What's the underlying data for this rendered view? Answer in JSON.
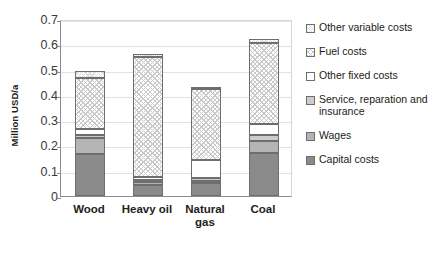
{
  "chart_data": {
    "type": "bar",
    "subtype": "stacked-bar",
    "title": "",
    "xlabel": "",
    "ylabel": "Million USD/a",
    "ylim": [
      0,
      0.7
    ],
    "ytick_labels": [
      "0.7",
      "0.6",
      "0.5",
      "0.4",
      "0.3",
      "0.2",
      "0.1",
      "0"
    ],
    "ytick_values": [
      0.7,
      0.6,
      0.5,
      0.4,
      0.3,
      0.2,
      0.1,
      0
    ],
    "grid": true,
    "legend_position": "right",
    "categories": [
      "Wood",
      "Heavy oil",
      "Natural gas",
      "Coal"
    ],
    "series": [
      {
        "name": "Capital costs",
        "values": [
          0.165,
          0.045,
          0.053,
          0.17
        ]
      },
      {
        "name": "Wages",
        "values": [
          0.065,
          0.01,
          0.008,
          0.048
        ]
      },
      {
        "name": "Service, reparation and insurance",
        "values": [
          0.012,
          0.01,
          0.01,
          0.025
        ]
      },
      {
        "name": "Other fixed costs",
        "values": [
          0.023,
          0.012,
          0.071,
          0.04
        ]
      },
      {
        "name": "Fuel costs",
        "values": [
          0.2,
          0.473,
          0.283,
          0.323
        ]
      },
      {
        "name": "Other variable costs",
        "values": [
          0.03,
          0.01,
          0.008,
          0.015
        ]
      }
    ],
    "totals": [
      0.495,
      0.56,
      0.433,
      0.621
    ]
  },
  "axis": {
    "y_title": "Million USD/a"
  },
  "xaxis": {
    "labels": [
      {
        "line1": "Wood",
        "line2": ""
      },
      {
        "line1": "Heavy oil",
        "line2": ""
      },
      {
        "line1": "Natural",
        "line2": "gas"
      },
      {
        "line1": "Coal",
        "line2": ""
      }
    ]
  },
  "legend": {
    "items": [
      {
        "label": "Other variable costs",
        "swatch": "hatch-light",
        "color": "#ffffff"
      },
      {
        "label": "Fuel costs",
        "swatch": "hatch-medium",
        "color": "#ffffff"
      },
      {
        "label": "Other fixed costs",
        "swatch": "solid-white",
        "color": "#ffffff"
      },
      {
        "label": "Service, reparation and",
        "label2": "insurance",
        "swatch": "solid-lightgray",
        "color": "#cccccc"
      },
      {
        "label": "Wages",
        "swatch": "solid-gray",
        "color": "#b4b4b4"
      },
      {
        "label": "Capital costs",
        "swatch": "solid-darkgray",
        "color": "#8a8a8a"
      }
    ]
  }
}
